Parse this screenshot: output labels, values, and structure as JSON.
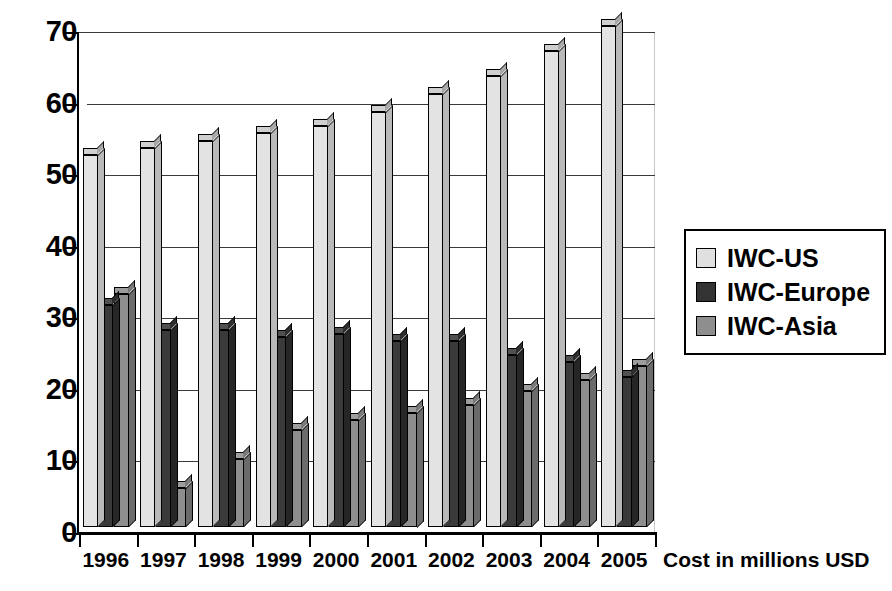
{
  "chart_data": {
    "type": "bar",
    "title": "",
    "subtitle": "",
    "xlabel": "Cost in millions USD",
    "ylabel": "",
    "categories": [
      "1996",
      "1997",
      "1998",
      "1999",
      "2000",
      "2001",
      "2002",
      "2003",
      "2004",
      "2005"
    ],
    "series": [
      {
        "name": "IWC-US",
        "color": "#e3e3e3",
        "values": [
          52,
          53,
          54,
          55,
          56,
          58,
          60.5,
          63,
          66.5,
          70
        ]
      },
      {
        "name": "IWC-Europe",
        "color": "#3a3a3a",
        "values": [
          31,
          27.5,
          27.5,
          26.5,
          27,
          26,
          26,
          24,
          23,
          21
        ]
      },
      {
        "name": "IWC-Asia",
        "color": "#8e8e8e",
        "values": [
          32.5,
          5.5,
          9.5,
          13.5,
          15,
          16,
          17,
          19,
          20.5,
          22.5
        ]
      }
    ],
    "ylim": [
      0,
      70
    ],
    "ytick_step": 10,
    "yticks": [
      "70",
      "60",
      "50",
      "40",
      "30",
      "20",
      "10",
      "0"
    ],
    "grid": true,
    "legend_position": "right",
    "style": "3d-clustered-column"
  },
  "legend": {
    "items": [
      {
        "label": "IWC-US",
        "swatch": "light-gray-swatch"
      },
      {
        "label": "IWC-Europe",
        "swatch": "dark-gray-swatch"
      },
      {
        "label": "IWC-Asia",
        "swatch": "medium-gray-swatch"
      }
    ]
  },
  "axis": {
    "x_title": "Cost in millions USD"
  }
}
